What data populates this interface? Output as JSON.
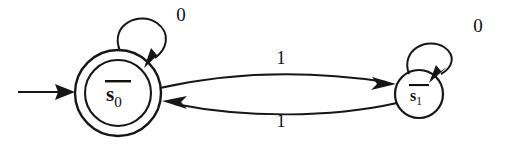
{
  "figure": {
    "type": "finite-state-machine",
    "background_color": "#ffffff",
    "ink_color": "#161616",
    "text_color": "#111111"
  },
  "states": [
    {
      "id": "s0",
      "label_base": "s",
      "label_subscript": "0",
      "overline": true,
      "shape": "double-circle",
      "accepting": true,
      "initial": true,
      "cx": 118,
      "cy": 93,
      "outer_r": 43,
      "inner_r": 33
    },
    {
      "id": "s1",
      "label_base": "s",
      "label_subscript": "1",
      "overline": true,
      "shape": "circle",
      "accepting": false,
      "initial": false,
      "cx": 419,
      "cy": 94,
      "outer_r": 24,
      "inner_r": 0
    }
  ],
  "transitions": [
    {
      "id": "s0-self",
      "from": "s0",
      "to": "s0",
      "symbol": "0",
      "kind": "self-loop",
      "label_x": 181,
      "label_y": 21
    },
    {
      "id": "s0-to-s1",
      "from": "s0",
      "to": "s1",
      "symbol": "1",
      "kind": "curve-top",
      "label_x": 281,
      "label_y": 64
    },
    {
      "id": "s1-to-s0",
      "from": "s1",
      "to": "s0",
      "symbol": "1",
      "kind": "curve-bottom",
      "label_x": 281,
      "label_y": 127
    },
    {
      "id": "s1-self",
      "from": "s1",
      "to": "s1",
      "symbol": "0",
      "kind": "self-loop",
      "label_x": 478,
      "label_y": 32
    }
  ],
  "start_arrow": {
    "id": "start-arrow",
    "target": "s0",
    "x_start": 18,
    "x_end": 75,
    "y": 92
  }
}
